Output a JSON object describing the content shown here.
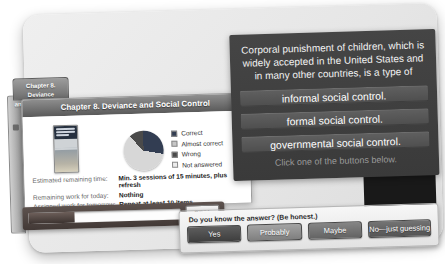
{
  "tab": {
    "line1": "Chapter 8. Deviance",
    "line2": "and Social Control"
  },
  "study_window": {
    "title": "Chapter 8. Deviance and Social Control",
    "legend": [
      {
        "label": "Correct",
        "color": "#323d52"
      },
      {
        "label": "Almost correct",
        "color": "#c6c6c6"
      },
      {
        "label": "Wrong",
        "color": "#4a4a4a"
      },
      {
        "label": "Not answered",
        "color": "#ececec"
      }
    ],
    "stats": [
      {
        "label": "Estimated remaining time:",
        "value": "Min. 3 sessions of 15 minutes, plus refresh"
      },
      {
        "label": "Remaining work for today:",
        "value": "Nothing"
      },
      {
        "label": "Assigned work for tomorrow:",
        "value": "Repeat at least 10 items"
      }
    ],
    "progress": {
      "percent": 30,
      "label": "30%"
    }
  },
  "question_panel": {
    "question_lines": [
      "Corporal punishment of children, which is",
      "widely accepted in the United States and",
      "in many other countries, is a type of"
    ],
    "options": [
      "informal social control.",
      "formal social control.",
      "governmental social control."
    ],
    "hint": "Click one of the buttons below."
  },
  "answer_bar": {
    "prompt": "Do you know the answer? (Be honest.)",
    "buttons": [
      "Yes",
      "Probably",
      "Maybe",
      "No—just guessing"
    ]
  },
  "chart_data": {
    "type": "pie",
    "labels": [
      "Correct",
      "Almost correct",
      "Wrong",
      "Not answered"
    ],
    "values": [
      28,
      0,
      12,
      60
    ],
    "legend_position": "right",
    "slices_clockwise_from_top": [
      {
        "label": "Correct",
        "value": 28,
        "color": "#323d52"
      },
      {
        "label": "Not answered",
        "value": 60,
        "color": "#d7d7d7"
      },
      {
        "label": "Wrong",
        "value": 12,
        "color": "#4a4a4a"
      }
    ]
  }
}
